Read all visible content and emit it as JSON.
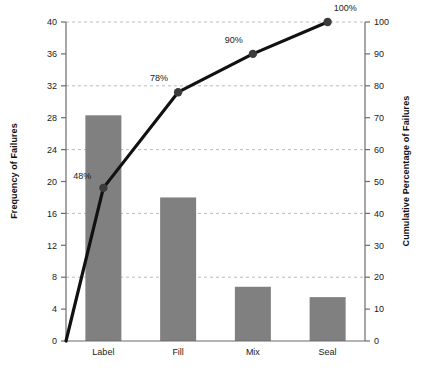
{
  "chart_data": {
    "type": "bar",
    "title": "",
    "categories": [
      "Label",
      "Fill",
      "Mix",
      "Seal"
    ],
    "series": [
      {
        "name": "Frequency of Failures",
        "type": "bar",
        "values": [
          28.3,
          18.0,
          6.8,
          5.5
        ],
        "color": "#808080",
        "axis": "left"
      },
      {
        "name": "Cumulative Percentage of Failures",
        "type": "line",
        "values": [
          48,
          78,
          90,
          100
        ],
        "point_labels": [
          "48%",
          "78%",
          "90%",
          "100%"
        ],
        "color": "#111111",
        "axis": "right",
        "starts_at_origin": true
      }
    ],
    "xlabel": "",
    "ylabel": "Frequency of Failures",
    "ylabel_right": "Cumulative Percentage of Failures",
    "ylim": [
      0,
      40
    ],
    "ylim_right": [
      0,
      100
    ],
    "yticks": [
      0,
      4,
      8,
      12,
      16,
      20,
      24,
      28,
      32,
      36,
      40
    ],
    "yticks_right": [
      0,
      10,
      20,
      30,
      40,
      50,
      60,
      70,
      80,
      90,
      100
    ],
    "ytick_labels": [
      "0",
      "4",
      "8",
      "12",
      "16",
      "20",
      "24",
      "28",
      "32",
      "36",
      "40"
    ],
    "ytick_labels_right": [
      "0",
      "10",
      "20",
      "30",
      "40",
      "50",
      "60",
      "70",
      "80",
      "90",
      "100"
    ],
    "gridlines_at": [
      8,
      16,
      24,
      32,
      40
    ],
    "grid": true,
    "legend": "none",
    "background": "#ffffff",
    "grid_color": "#bbbbbb",
    "axis_color": "#6b6b6b"
  }
}
